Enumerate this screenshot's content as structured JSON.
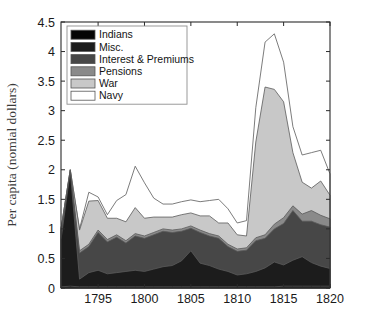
{
  "chart_data": {
    "type": "area",
    "stacked": true,
    "title": "",
    "xlabel": "",
    "ylabel": "Per capita (nomial dollars)",
    "xlim": [
      1791,
      1820
    ],
    "ylim": [
      0,
      4.5
    ],
    "xticks": [
      1795,
      1800,
      1805,
      1810,
      1815,
      1820
    ],
    "xtick_labels": [
      "1795",
      "1800",
      "1805",
      "1810",
      "1815",
      "1820"
    ],
    "yticks": [
      0,
      0.5,
      1,
      1.5,
      2,
      2.5,
      3,
      3.5,
      4,
      4.5
    ],
    "ytick_labels": [
      "0",
      "0.5",
      "1",
      "1.5",
      "2",
      "2.5",
      "3",
      "3.5",
      "4",
      "4.5"
    ],
    "grid": false,
    "legend_position": "top-left",
    "x": [
      1791,
      1792,
      1793,
      1794,
      1795,
      1796,
      1797,
      1798,
      1799,
      1800,
      1801,
      1802,
      1803,
      1804,
      1805,
      1806,
      1807,
      1808,
      1809,
      1810,
      1811,
      1812,
      1813,
      1814,
      1815,
      1816,
      1817,
      1818,
      1819,
      1820
    ],
    "series": [
      {
        "name": "Indians",
        "color": "#050505",
        "values": [
          0.02,
          0.03,
          0.02,
          0.02,
          0.02,
          0.02,
          0.02,
          0.02,
          0.02,
          0.02,
          0.02,
          0.02,
          0.02,
          0.02,
          0.02,
          0.02,
          0.02,
          0.02,
          0.02,
          0.02,
          0.02,
          0.02,
          0.02,
          0.02,
          0.03,
          0.03,
          0.03,
          0.03,
          0.03,
          0.03
        ]
      },
      {
        "name": "Misc.",
        "color": "#1c1c1c",
        "values": [
          0.8,
          1.94,
          0.13,
          0.24,
          0.28,
          0.22,
          0.24,
          0.26,
          0.28,
          0.26,
          0.3,
          0.34,
          0.36,
          0.44,
          0.61,
          0.4,
          0.36,
          0.3,
          0.26,
          0.2,
          0.22,
          0.26,
          0.32,
          0.42,
          0.36,
          0.44,
          0.5,
          0.4,
          0.34,
          0.3
        ]
      },
      {
        "name": "Interest & Premiums",
        "color": "#474747",
        "values": [
          0.13,
          0.0,
          0.44,
          0.44,
          0.64,
          0.54,
          0.6,
          0.48,
          0.58,
          0.56,
          0.58,
          0.6,
          0.56,
          0.5,
          0.38,
          0.52,
          0.5,
          0.52,
          0.42,
          0.4,
          0.4,
          0.52,
          0.5,
          0.56,
          0.7,
          0.84,
          0.6,
          0.7,
          0.7,
          0.7
        ]
      },
      {
        "name": "Pensions",
        "color": "#8a8a8a",
        "values": [
          0.05,
          0.03,
          0.04,
          0.04,
          0.04,
          0.04,
          0.04,
          0.04,
          0.04,
          0.04,
          0.04,
          0.04,
          0.04,
          0.04,
          0.04,
          0.04,
          0.04,
          0.04,
          0.04,
          0.04,
          0.04,
          0.05,
          0.06,
          0.08,
          0.1,
          0.08,
          0.12,
          0.18,
          0.16,
          0.14
        ]
      },
      {
        "name": "War",
        "color": "#c8c8c8",
        "values": [
          0.0,
          0.0,
          0.35,
          0.73,
          0.5,
          0.36,
          0.28,
          0.32,
          0.44,
          0.3,
          0.26,
          0.2,
          0.22,
          0.24,
          0.22,
          0.24,
          0.3,
          0.22,
          0.36,
          0.24,
          0.2,
          1.62,
          2.5,
          2.28,
          1.96,
          0.9,
          0.54,
          0.38,
          0.58,
          0.4
        ]
      },
      {
        "name": "Navy",
        "color": "#ffffff",
        "values": [
          0.0,
          0.0,
          0.02,
          0.15,
          0.06,
          0.06,
          0.3,
          0.46,
          0.7,
          0.6,
          0.32,
          0.22,
          0.22,
          0.22,
          0.22,
          0.24,
          0.26,
          0.4,
          0.24,
          0.2,
          0.26,
          0.58,
          0.76,
          0.94,
          0.67,
          0.44,
          0.46,
          0.6,
          0.52,
          0.36
        ]
      }
    ]
  },
  "legend": {
    "items": [
      {
        "label": "Indians"
      },
      {
        "label": "Misc."
      },
      {
        "label": "Interest & Premiums"
      },
      {
        "label": "Pensions"
      },
      {
        "label": "War"
      },
      {
        "label": "Navy"
      }
    ]
  }
}
